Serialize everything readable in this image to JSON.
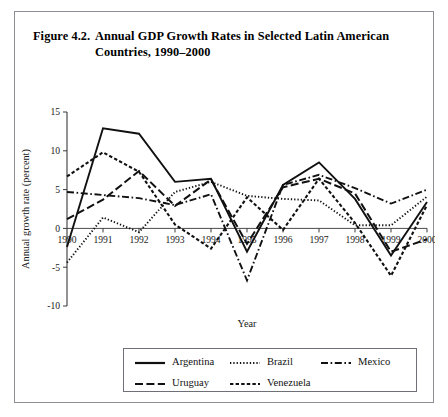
{
  "figure": {
    "label": "Figure 4.2.",
    "title": "Annual GDP Growth Rates in Selected Latin American Countries, 1990–2000"
  },
  "chart_data": {
    "type": "line",
    "title": "Annual GDP Growth Rates in Selected Latin American Countries, 1990–2000",
    "xlabel": "Year",
    "ylabel": "Annual growth rate (percent)",
    "x": [
      1990,
      1991,
      1992,
      1993,
      1994,
      1995,
      1996,
      1997,
      1998,
      1999,
      2000
    ],
    "xtick_labels": [
      "1990",
      "1991",
      "1992",
      "1993",
      "1994",
      "1995",
      "1996",
      "1997",
      "1998",
      "1999",
      "2000"
    ],
    "ytick_labels": [
      "15",
      "10",
      "5",
      "0",
      "-5",
      "-10"
    ],
    "ytick_values": [
      15,
      10,
      5,
      0,
      -5,
      -10
    ],
    "xlim": [
      1990,
      2000
    ],
    "ylim": [
      -10,
      15
    ],
    "grid": false,
    "legend_position": "bottom",
    "series": [
      {
        "name": "Argentina",
        "style": "solid",
        "values": [
          -2.4,
          12.9,
          12.2,
          6.0,
          6.4,
          -3.0,
          5.6,
          8.5,
          3.8,
          -3.5,
          3.4
        ]
      },
      {
        "name": "Brazil",
        "style": "dotted",
        "values": [
          -4.4,
          1.4,
          -0.5,
          4.7,
          6.0,
          4.2,
          3.8,
          3.6,
          0.4,
          0.4,
          4.1
        ]
      },
      {
        "name": "Mexico",
        "style": "dash-dot",
        "values": [
          4.7,
          4.3,
          3.9,
          3.0,
          4.4,
          -6.7,
          5.6,
          6.9,
          5.2,
          3.2,
          5.0
        ]
      },
      {
        "name": "Uruguay",
        "style": "long-dash",
        "values": [
          1.2,
          3.7,
          7.4,
          2.9,
          6.3,
          -2.0,
          5.3,
          6.4,
          4.5,
          -3.0,
          -1.4
        ]
      },
      {
        "name": "Venezuela",
        "style": "dashed",
        "values": [
          6.7,
          9.8,
          7.3,
          0.5,
          -2.6,
          4.0,
          -0.2,
          6.4,
          0.7,
          -6.1,
          3.0
        ]
      }
    ]
  },
  "legend": {
    "entries": [
      {
        "label": "Argentina",
        "style": "solid"
      },
      {
        "label": "Brazil",
        "style": "dotted"
      },
      {
        "label": "Mexico",
        "style": "dash-dot"
      },
      {
        "label": "Uruguay",
        "style": "long-dash"
      },
      {
        "label": "Venezuela",
        "style": "dashed"
      }
    ]
  }
}
